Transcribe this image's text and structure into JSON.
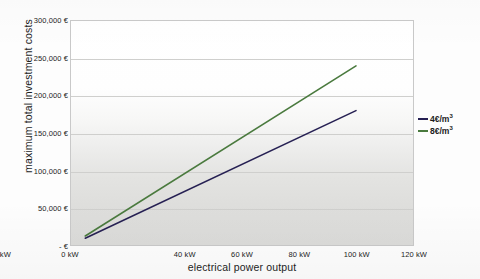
{
  "chart_data": {
    "type": "line",
    "title": "",
    "xlabel": "electrical power output",
    "ylabel": "maximum total investment costs",
    "xlim": [
      0,
      120
    ],
    "ylim": [
      0,
      300000
    ],
    "grid": true,
    "legend_position": "right",
    "x_ticks": [
      "0 kW",
      "20 kW",
      "40 kW",
      "60 kW",
      "80 kW",
      "100 kW",
      "120 kW"
    ],
    "x_tick_values": [
      0,
      20,
      40,
      60,
      80,
      100,
      120
    ],
    "y_ticks": [
      "-   €",
      "50,000 €",
      "100,000 €",
      "150,000 €",
      "200,000 €",
      "250,000 €",
      "300,000 €"
    ],
    "y_tick_values": [
      0,
      50000,
      100000,
      150000,
      200000,
      250000,
      300000
    ],
    "x": [
      5,
      100
    ],
    "series": [
      {
        "name": "4€/m",
        "exponent": "3",
        "color": "#262053",
        "values": [
          9000,
          180000
        ]
      },
      {
        "name": "8€/m",
        "exponent": "3",
        "color": "#4a7a3e",
        "values": [
          12000,
          240000
        ]
      }
    ]
  },
  "legend": {
    "items": [
      {
        "label": "4€/m",
        "exponent": "3",
        "color": "#262053"
      },
      {
        "label": "8€/m",
        "exponent": "3",
        "color": "#4a7a3e"
      }
    ]
  }
}
